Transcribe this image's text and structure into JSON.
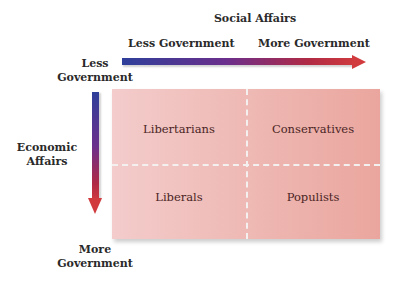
{
  "diagram": {
    "x_axis": {
      "title": "Social Affairs",
      "left_label": "Less Government",
      "right_label": "More Government",
      "gradient_colors": [
        "#2e3f9a",
        "#6b2f8c",
        "#cf3a3e"
      ]
    },
    "y_axis": {
      "title_line1": "Economic",
      "title_line2": "Affairs",
      "top_label_line1": "Less",
      "top_label_line2": "Government",
      "bottom_label_line1": "More",
      "bottom_label_line2": "Government",
      "gradient_colors": [
        "#2e3f9a",
        "#6b2f8c",
        "#cf3a3e"
      ]
    },
    "quadrants": {
      "top_left": "Libertarians",
      "top_right": "Conservatives",
      "bottom_left": "Liberals",
      "bottom_right": "Populists"
    },
    "colors": {
      "box_left": "#f3cccb",
      "box_right": "#eaa69e",
      "divider": "#f4f0ef"
    }
  }
}
